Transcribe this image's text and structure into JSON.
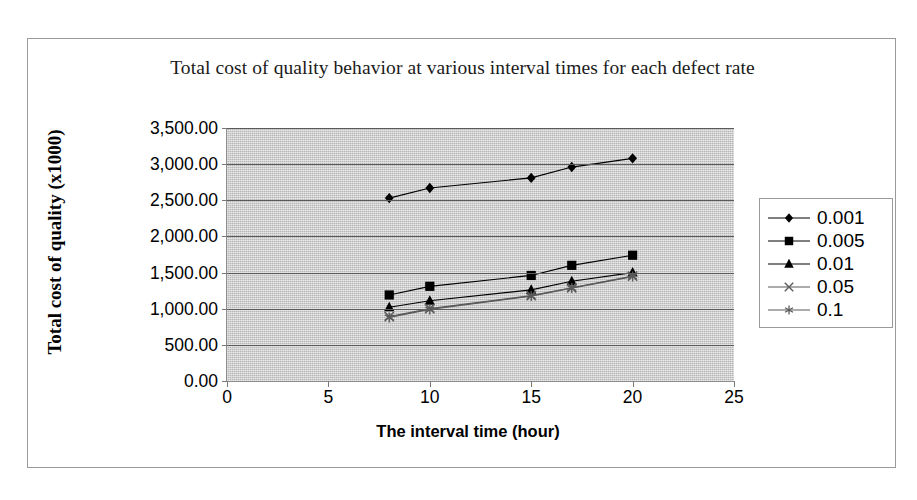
{
  "chart_data": {
    "type": "line",
    "title": "Total cost of quality behavior at various interval times for each defect rate",
    "xlabel": "The interval time (hour)",
    "ylabel": "Total cost of quality (x1000)",
    "x": [
      8,
      10,
      15,
      17,
      20
    ],
    "xlim": [
      0,
      25
    ],
    "ylim": [
      0,
      3500
    ],
    "xticks": [
      "0",
      "5",
      "10",
      "15",
      "20",
      "25"
    ],
    "xtick_values": [
      0,
      5,
      10,
      15,
      20,
      25
    ],
    "yticks": [
      "0.00",
      "500.00",
      "1,000.00",
      "1,500.00",
      "2,000.00",
      "2,500.00",
      "3,000.00",
      "3,500.00"
    ],
    "ytick_values": [
      0,
      500,
      1000,
      1500,
      2000,
      2500,
      3000,
      3500
    ],
    "grid": "horizontal",
    "legend_position": "right",
    "plot_background": "#c9c9c9",
    "series": [
      {
        "name": "0.001",
        "marker": "diamond",
        "color": "#000000",
        "values": [
          2530,
          2670,
          2810,
          2960,
          3080
        ]
      },
      {
        "name": "0.005",
        "marker": "square",
        "color": "#000000",
        "values": [
          1190,
          1310,
          1460,
          1600,
          1740
        ]
      },
      {
        "name": "0.01",
        "marker": "triangle",
        "color": "#000000",
        "values": [
          1020,
          1110,
          1260,
          1380,
          1500
        ]
      },
      {
        "name": "0.05",
        "marker": "cross",
        "color": "#5a5a5a",
        "values": [
          890,
          1000,
          1180,
          1290,
          1450
        ]
      },
      {
        "name": "0.1",
        "marker": "star",
        "color": "#5a5a5a",
        "values": [
          880,
          990,
          1175,
          1285,
          1445
        ]
      }
    ]
  }
}
